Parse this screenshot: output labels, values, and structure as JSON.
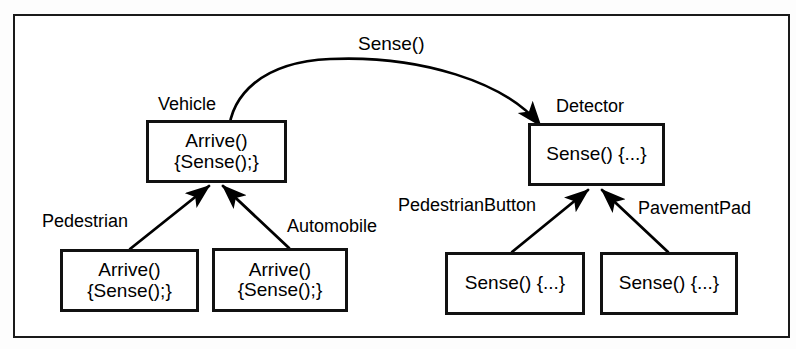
{
  "diagram": {
    "title_label": "Sense()",
    "message_arrow": {
      "label": "Sense()",
      "from": "Vehicle",
      "to": "Detector"
    },
    "left_hierarchy": {
      "base": {
        "name": "Vehicle",
        "body_line1": "Arrive()",
        "body_line2": "{Sense();}"
      },
      "subclasses": [
        {
          "name": "Pedestrian",
          "body_line1": "Arrive()",
          "body_line2": "{Sense();}"
        },
        {
          "name": "Automobile",
          "body_line1": "Arrive()",
          "body_line2": "{Sense();}"
        }
      ]
    },
    "right_hierarchy": {
      "base": {
        "name": "Detector",
        "body_line1": "Sense() {...}",
        "body_line2": ""
      },
      "subclasses": [
        {
          "name": "PedestrianButton",
          "body_line1": "Sense() {...}",
          "body_line2": ""
        },
        {
          "name": "PavementPad",
          "body_line1": "Sense() {...}",
          "body_line2": ""
        }
      ]
    },
    "colors": {
      "ink": "#000000",
      "paper": "#ffffff",
      "frame": "#1a1a1a"
    }
  }
}
